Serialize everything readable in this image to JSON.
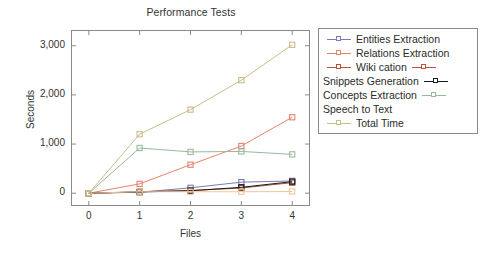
{
  "chart_data": {
    "type": "line",
    "title": "Performance Tests",
    "xlabel": "Files",
    "ylabel": "Seconds",
    "x": [
      0,
      1,
      2,
      3,
      4
    ],
    "xticklabels": [
      "0",
      "1",
      "2",
      "3",
      "4"
    ],
    "yticklabels": [
      "0",
      "1,000",
      "2,000",
      "3,000"
    ],
    "yticks": [
      0,
      1000,
      2000,
      3000
    ],
    "xlim": [
      -0.35,
      4.35
    ],
    "ylim": [
      -260,
      3320
    ],
    "grid": false,
    "legend_position": "right-outside",
    "marker": "open-square",
    "series": [
      {
        "name": "Entities Extraction",
        "color": "#7b7bb5",
        "values": [
          0,
          20,
          110,
          225,
          250
        ],
        "legend_marker_side": "left"
      },
      {
        "name": "Relations Extraction",
        "color": "#e8836b",
        "values": [
          0,
          190,
          580,
          960,
          1545
        ],
        "legend_marker_side": "left"
      },
      {
        "name": "Wiki cation",
        "color": "#b5523c",
        "values": [
          0,
          30,
          55,
          105,
          215
        ],
        "legend_marker_side": "both"
      },
      {
        "name": "Snippets Generation",
        "color": "#1a1a1a",
        "values": [
          0,
          25,
          50,
          120,
          235
        ],
        "legend_marker_side": "right"
      },
      {
        "name": "Concepts Extraction",
        "color": "#9ab99a",
        "values": [
          0,
          920,
          840,
          850,
          790
        ],
        "legend_marker_side": "right"
      },
      {
        "name": "Speech to Text",
        "color": "#f0c79a",
        "values": [
          0,
          30,
          30,
          30,
          35
        ],
        "legend_marker_side": "none"
      },
      {
        "name": "Total Time",
        "color": "#c9bd8a",
        "values": [
          0,
          1200,
          1700,
          2300,
          3020
        ],
        "legend_marker_side": "left"
      }
    ]
  },
  "axes": {
    "frame_color": "#8a8a8a"
  }
}
